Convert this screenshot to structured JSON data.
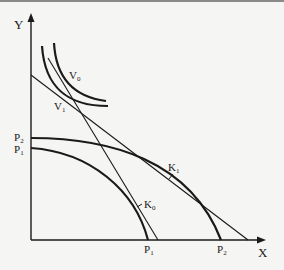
{
  "diagram": {
    "axes": {
      "y_label": "Y",
      "x_label": "X"
    },
    "curves": {
      "ppf_inner": {
        "y_intercept_label": "P",
        "y_intercept_sub": "1",
        "x_intercept_label": "P",
        "x_intercept_sub": "1"
      },
      "ppf_outer": {
        "y_intercept_label": "P",
        "y_intercept_sub": "2",
        "x_intercept_label": "P",
        "x_intercept_sub": "2"
      },
      "indifference_upper": {
        "label": "V",
        "sub": "0"
      },
      "indifference_lower": {
        "label": "V",
        "sub": "1"
      }
    },
    "points": {
      "k0": {
        "label": "K",
        "sub": "0"
      },
      "k1": {
        "label": "K",
        "sub": "1"
      }
    },
    "colors": {
      "ink": "#1a1a1a",
      "background": "#f5f5f3",
      "top_border": "#8a8a8a"
    }
  }
}
